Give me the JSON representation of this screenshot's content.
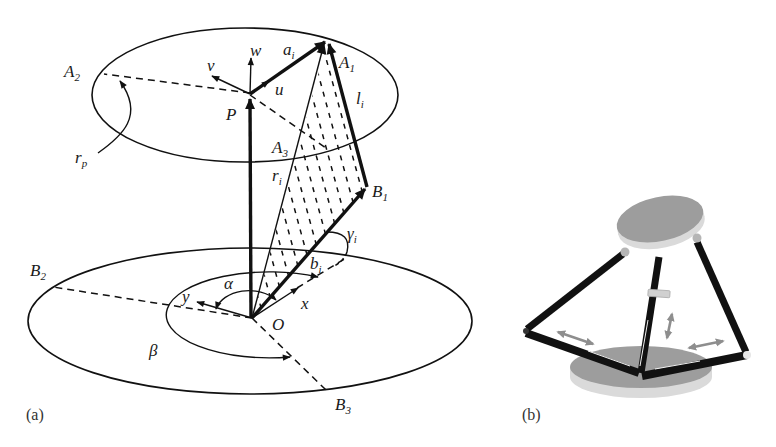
{
  "figure": {
    "panel_a": {
      "panel_label": "(a)",
      "labels": {
        "w": {
          "main": "w"
        },
        "a_i": {
          "main": "a",
          "sub": "i"
        },
        "A_1": {
          "main": "A",
          "sub": "1"
        },
        "A_2": {
          "main": "A",
          "sub": "2"
        },
        "A_3": {
          "main": "A",
          "sub": "3"
        },
        "v": {
          "main": "v"
        },
        "u": {
          "main": "u"
        },
        "P": {
          "main": "P"
        },
        "l_i": {
          "main": "l",
          "sub": "i"
        },
        "r_p": {
          "main": "r",
          "sub": "p"
        },
        "r_i": {
          "main": "r",
          "sub": "i"
        },
        "B_1": {
          "main": "B",
          "sub": "1"
        },
        "B_2": {
          "main": "B",
          "sub": "2"
        },
        "B_3": {
          "main": "B",
          "sub": "3"
        },
        "gamma_i": {
          "main": "γ",
          "sub": "i"
        },
        "b_i": {
          "main": "b",
          "sub": "i"
        },
        "alpha": {
          "main": "α"
        },
        "beta": {
          "main": "β"
        },
        "y": {
          "main": "y"
        },
        "x": {
          "main": "x"
        },
        "O": {
          "main": "O"
        }
      }
    },
    "panel_b": {
      "panel_label": "(b)"
    }
  },
  "colors": {
    "line": "#111111",
    "platform_top": "#9d9d9d",
    "platform_side": "#dadada",
    "joint": "#b5b5b5",
    "motion_arrow": "#8e8e8e",
    "slider_block": "#d0d0d0"
  }
}
